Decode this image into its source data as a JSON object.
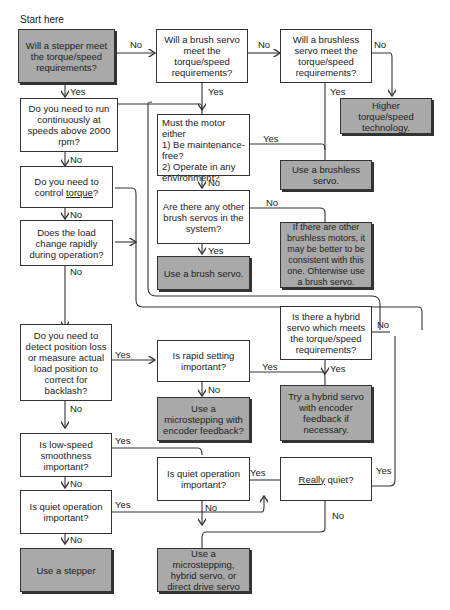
{
  "title": "Start here",
  "nodes": {
    "stepper_meet": "Will a stepper meet the torque/speed requirements?",
    "brush_meet": "Will a brush servo meet the torque/speed requirements?",
    "brushless_meet": "Will a brushless servo meet the torque/speed requirements?",
    "higher_tech": "Higher torque/speed technology.",
    "run_2000": "Do you need to run continuously at speeds above 2000 rpm?",
    "must_motor_l1": "Must the motor either",
    "must_motor_l2": "1)  Be maintenance-free?",
    "must_motor_l3": "2)  Operate in any environment?",
    "use_brushless": "Use a brushless servo.",
    "control_torque_pre": "Do you need to control ",
    "control_torque_u": "torque",
    "control_torque_post": "?",
    "other_brush": "Are there any other brush servos in the system?",
    "brushless_note": "If there are other brushless motors, it may be better to be consistent with this one. Ohterwise use a brush servo.",
    "load_change": "Does the load change rapidly during operation?",
    "use_brush": "Use a brush servo.",
    "hybrid_meet": "Is there a hybrid servo which meets the torque/speed requirements?",
    "detect_position": "Do you need to detect position loss or measure actual load position to correct for backlash?",
    "rapid_setting": "Is rapid setting important?",
    "try_hybrid": "Try a hybrid servo with encoder feedback if necessary.",
    "use_microstep_enc": "Use a microstepping with encoder feedback?",
    "low_speed": "Is low-speed smoothness important?",
    "quiet_mid": "Is quiet operation important?",
    "really_quiet_u": "Really",
    "really_quiet_post": " quiet?",
    "quiet_left": "Is quiet operation important?",
    "use_stepper": "Use a stepper",
    "use_micro_hybrid": "Use a microstepping, hybrid servo, or direct drive servo"
  },
  "labels": {
    "yes": "Yes",
    "no": "No"
  },
  "colors": {
    "terminal_fill": "#a9a9a9",
    "line": "#333333"
  }
}
